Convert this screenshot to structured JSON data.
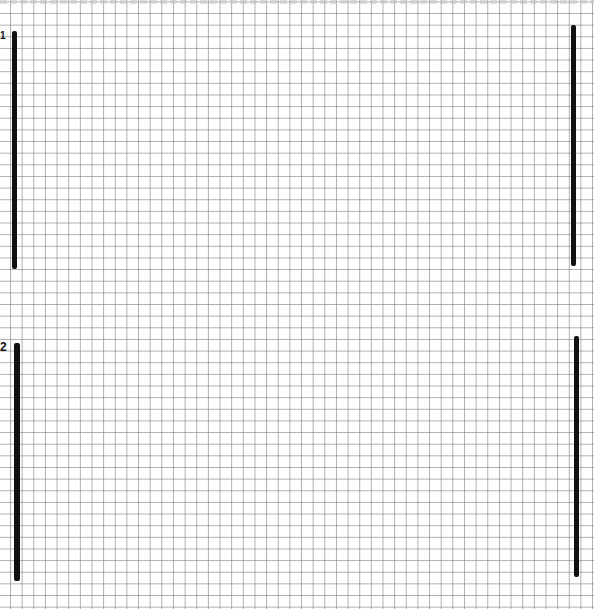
{
  "page": {
    "background": "#ffffff",
    "grid_color": "#6e6e6e",
    "bar_color": "#111111"
  },
  "sections": [
    {
      "label": "1"
    },
    {
      "label": "2"
    }
  ]
}
